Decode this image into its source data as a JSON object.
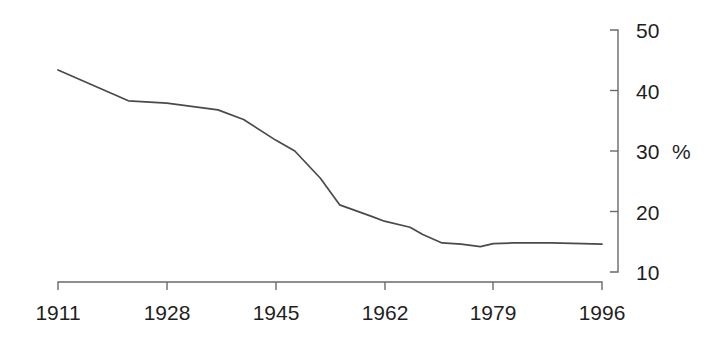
{
  "chart_data": {
    "type": "line",
    "title": "",
    "subtitle": "",
    "xlabel": "",
    "ylabel": "%",
    "grid": false,
    "legend": false,
    "legend_position": "none",
    "y_axis_side": "right",
    "xlim": [
      1911,
      1996
    ],
    "ylim": [
      10,
      50
    ],
    "xticks": [
      1911,
      1928,
      1945,
      1962,
      1979,
      1996
    ],
    "xtick_labels": [
      "1911",
      "1928",
      "1945",
      "1962",
      "1979",
      "1996"
    ],
    "yticks": [
      10,
      20,
      30,
      40,
      50
    ],
    "ytick_labels": [
      "10",
      "20",
      "30",
      "40",
      "50"
    ],
    "unit_label": "%",
    "line_color": "#4a4a4a",
    "axis_color": "#6a6a6a",
    "background_color": "#ffffff",
    "series": [
      {
        "name": "share",
        "x": [
          1911,
          1922,
          1928,
          1936,
          1940,
          1945,
          1948,
          1952,
          1955,
          1960,
          1962,
          1966,
          1968,
          1971,
          1974,
          1977,
          1979,
          1982,
          1988,
          1993,
          1996
        ],
        "values": [
          43.4,
          38.3,
          37.9,
          36.8,
          35.2,
          31.8,
          30.0,
          25.5,
          21.1,
          19.2,
          18.4,
          17.4,
          16.2,
          14.8,
          14.6,
          14.2,
          14.7,
          14.8,
          14.8,
          14.7,
          14.6
        ]
      }
    ],
    "annotations": []
  }
}
